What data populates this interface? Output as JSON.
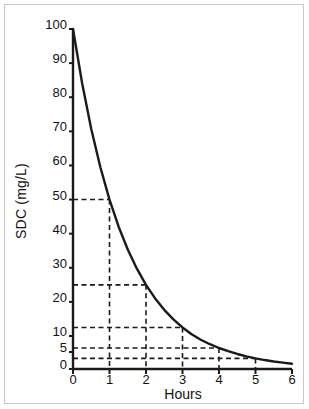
{
  "chart_data": {
    "type": "line",
    "title": "",
    "xlabel": "Hours",
    "ylabel": "SDC (mg/L)",
    "xlim": [
      0,
      6
    ],
    "ylim": [
      0,
      100
    ],
    "grid": false,
    "legend": "none",
    "y_tick_labels": [
      "0",
      "5",
      "10",
      "20",
      "30",
      "40",
      "50",
      "60",
      "70",
      "80",
      "90",
      "100"
    ],
    "y_tick_values": [
      0,
      5,
      10,
      20,
      30,
      40,
      50,
      60,
      70,
      80,
      90,
      100
    ],
    "x_tick_labels": [
      "0",
      "1",
      "2",
      "3",
      "4",
      "5",
      "6"
    ],
    "x_tick_values": [
      0,
      1,
      2,
      3,
      4,
      5,
      6
    ],
    "series": [
      {
        "name": "Serum drug concentration",
        "x": [
          0,
          0.25,
          0.5,
          0.75,
          1,
          1.25,
          1.5,
          1.75,
          2,
          2.25,
          2.5,
          2.75,
          3,
          3.25,
          3.5,
          3.75,
          4,
          4.25,
          4.5,
          4.75,
          5,
          5.25,
          5.5,
          5.75,
          6
        ],
        "values": [
          100,
          84.09,
          70.71,
          59.46,
          50,
          42.04,
          35.36,
          29.73,
          25,
          21.02,
          17.68,
          14.87,
          12.5,
          10.51,
          8.84,
          7.43,
          6.25,
          5.26,
          4.42,
          3.72,
          3.125,
          2.63,
          2.21,
          1.86,
          1.5625
        ]
      }
    ],
    "annotations": [
      {
        "label": "half-life-1",
        "hours": 1,
        "sdc": 50
      },
      {
        "label": "half-life-2",
        "hours": 2,
        "sdc": 25
      },
      {
        "label": "half-life-3",
        "hours": 3,
        "sdc": 12.5
      },
      {
        "label": "half-life-4",
        "hours": 4,
        "sdc": 6.25
      },
      {
        "label": "half-life-5",
        "hours": 5,
        "sdc": 3.125
      }
    ],
    "guide_lines_style": "dashed",
    "curve_color": "#1a1a1a",
    "axis_color": "#1a1a1a",
    "guide_color": "#1a1a1a",
    "background_color": "#ffffff",
    "border_color": "#c9c9c9"
  }
}
